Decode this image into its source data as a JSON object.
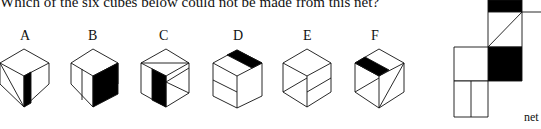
{
  "question": "Which of the six cubes below could not be made from this net?",
  "options": [
    {
      "label": "A"
    },
    {
      "label": "B"
    },
    {
      "label": "C"
    },
    {
      "label": "D"
    },
    {
      "label": "E"
    },
    {
      "label": "F"
    }
  ],
  "net_label": "net",
  "colors": {
    "ink": "#111111",
    "fill": "#000000",
    "paper": "#ffffff"
  }
}
